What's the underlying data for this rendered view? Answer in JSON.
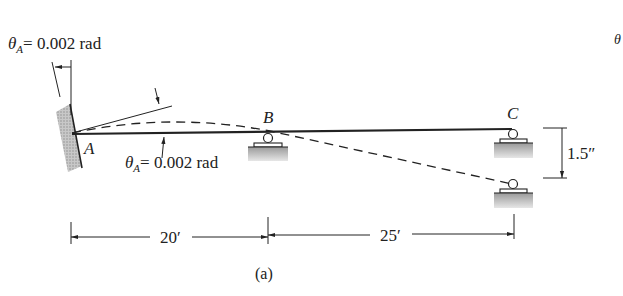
{
  "figure": {
    "caption": "(a)",
    "points": {
      "A": "A",
      "B": "B",
      "C": "C"
    },
    "rotation_top": {
      "symbol": "θ",
      "subscript": "A",
      "value": "= 0.002 rad"
    },
    "rotation_bottom": {
      "symbol": "θ",
      "subscript": "A",
      "value": "= 0.002 rad"
    },
    "settlement": {
      "value": "1.5″"
    },
    "dimensions": {
      "span_AB": "20′",
      "span_BC": "25′"
    },
    "edge_fragment": "θ",
    "colors": {
      "line": "#222222",
      "hatch": "#a0a0a0"
    }
  }
}
